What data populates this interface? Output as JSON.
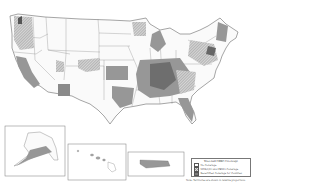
{
  "map": {
    "title": "Year-end CDBG Coverage",
    "region": "United States counties",
    "insets": [
      "Alaska",
      "Hawaii",
      "Puerto Rico"
    ]
  },
  "legend": {
    "title": "Year-end CDBG Coverage",
    "items": [
      {
        "label": "No Coverage",
        "pattern": "none",
        "color": "#ffffff"
      },
      {
        "label": "MDS/QIO and FEMA Coverage",
        "pattern": "hatched",
        "color": "#b5b5b5"
      },
      {
        "label": "Recertified Coverage for Counties",
        "pattern": "solid",
        "color": "#7a7a7a"
      }
    ]
  },
  "note": "Note: Territories are shown in relative proportions",
  "colors": {
    "background": "#ffffff",
    "border": "#777777",
    "light_fill": "#c8c8c8",
    "mid_fill": "#a8a8a8",
    "dark_fill": "#6e6e6e"
  }
}
